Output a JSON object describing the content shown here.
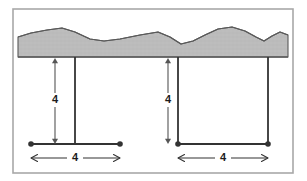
{
  "figure": {
    "background_color": "#ffffff",
    "frame": {
      "name": "figure-border",
      "x": 13,
      "y": 9,
      "width": 280,
      "height": 164,
      "stroke_color": "#a8a8a8",
      "stroke_width": 1.6,
      "fill": "none"
    },
    "ground": {
      "name": "ground-terrain-band",
      "fill_color": "#b8b8b8",
      "stroke_color": "#5a5a5a",
      "stroke_width": 1.1,
      "baseline_y": 57,
      "left_x": 18,
      "right_x": 288,
      "profile_points": "18,37 31,33 47,30 62,28 75,32 90,39 104,41 120,39 140,35 158,32 170,37 181,44 193,41 205,35 218,29 232,27 245,31 256,37 264,41 272,36 280,32 288,35",
      "description": "Jagged hatched terrain slab with irregular upper edge and flat lower edge"
    },
    "structures": [
      {
        "id": "left-structure",
        "name": "left-t-structure",
        "shape": "T-shape with single central post",
        "post_x": 75,
        "post_top_y": 57,
        "post_bottom_y": 144,
        "beam_y": 144,
        "beam_left_x": 31,
        "beam_right_x": 120,
        "stroke_color": "#333333",
        "stroke_width": 1.8,
        "endpoints": [
          {
            "name": "left-endpoint-dot",
            "cx": 31,
            "cy": 144,
            "r": 2.8
          },
          {
            "name": "right-endpoint-dot",
            "cx": 120,
            "cy": 144,
            "r": 2.8
          }
        ],
        "height_dimension": {
          "name": "left-height-dimension",
          "label": "4",
          "x": 55,
          "top_y": 58,
          "bottom_y": 144,
          "label_y": 100,
          "stroke_color": "#555555",
          "stroke_width": 1.1,
          "orientation": "vertical",
          "arrowheads": "both"
        },
        "width_dimension": {
          "name": "left-width-dimension",
          "label": "4",
          "y": 158,
          "left_x": 31,
          "right_x": 120,
          "label_x": 75,
          "stroke_color": "#333333",
          "stroke_width": 1.1,
          "orientation": "horizontal",
          "arrowheads": "both"
        }
      },
      {
        "id": "right-structure",
        "name": "right-u-structure",
        "shape": "U-shape with two posts forming a rectangle",
        "post_left_x": 178,
        "post_right_x": 268,
        "post_top_y": 57,
        "post_bottom_y": 144,
        "beam_y": 144,
        "beam_left_x": 178,
        "beam_right_x": 268,
        "stroke_color": "#333333",
        "stroke_width": 1.8,
        "endpoints": [
          {
            "name": "left-endpoint-dot",
            "cx": 178,
            "cy": 144,
            "r": 2.8
          },
          {
            "name": "right-endpoint-dot",
            "cx": 268,
            "cy": 144,
            "r": 2.8
          }
        ],
        "height_dimension": {
          "name": "right-height-dimension",
          "label": "4",
          "x": 168,
          "top_y": 58,
          "bottom_y": 144,
          "label_y": 100,
          "stroke_color": "#555555",
          "stroke_width": 1.1,
          "orientation": "vertical",
          "arrowheads": "both"
        },
        "width_dimension": {
          "name": "right-width-dimension",
          "label": "4",
          "y": 158,
          "left_x": 178,
          "right_x": 268,
          "label_x": 223,
          "stroke_color": "#333333",
          "stroke_width": 1.1,
          "orientation": "horizontal",
          "arrowheads": "both"
        }
      }
    ],
    "labels": {
      "left_height": "4",
      "left_width": "4",
      "right_height": "4",
      "right_width": "4"
    },
    "colors": {
      "ground_fill": "#b8b8b8",
      "ground_stroke": "#5a5a5a",
      "structure_stroke": "#333333",
      "dimension_stroke": "#555555",
      "frame_stroke": "#a8a8a8",
      "label_text": "#1c1c1c",
      "background": "#ffffff"
    }
  }
}
